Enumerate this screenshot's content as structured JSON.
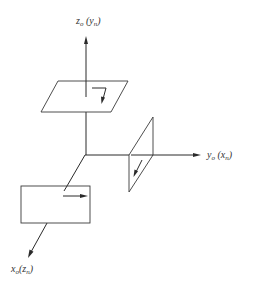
{
  "diagram": {
    "type": "3d-coordinate-axes-with-planes",
    "origin": [
      85,
      155
    ],
    "axes": [
      {
        "id": "z",
        "label_main": "z",
        "label_main_sub": "o",
        "label_paren": "y",
        "label_paren_sub": "n",
        "direction": "up"
      },
      {
        "id": "y",
        "label_main": "y",
        "label_main_sub": "o",
        "label_paren": "x",
        "label_paren_sub": "n",
        "direction": "right"
      },
      {
        "id": "x",
        "label_main": "x",
        "label_main_sub": "o",
        "label_paren": "z",
        "label_paren_sub": "n",
        "direction": "down-left"
      }
    ],
    "planes": [
      {
        "id": "horizontal-plane",
        "axis": "z",
        "arrow": "bent (right then down-left)"
      },
      {
        "id": "vertical-side-plane",
        "axis": "y",
        "arrow": "down-left"
      },
      {
        "id": "front-plane",
        "axis": "x",
        "arrow": "right"
      }
    ],
    "colors": {
      "line": "#2a2a2a",
      "background": "#ffffff"
    }
  }
}
